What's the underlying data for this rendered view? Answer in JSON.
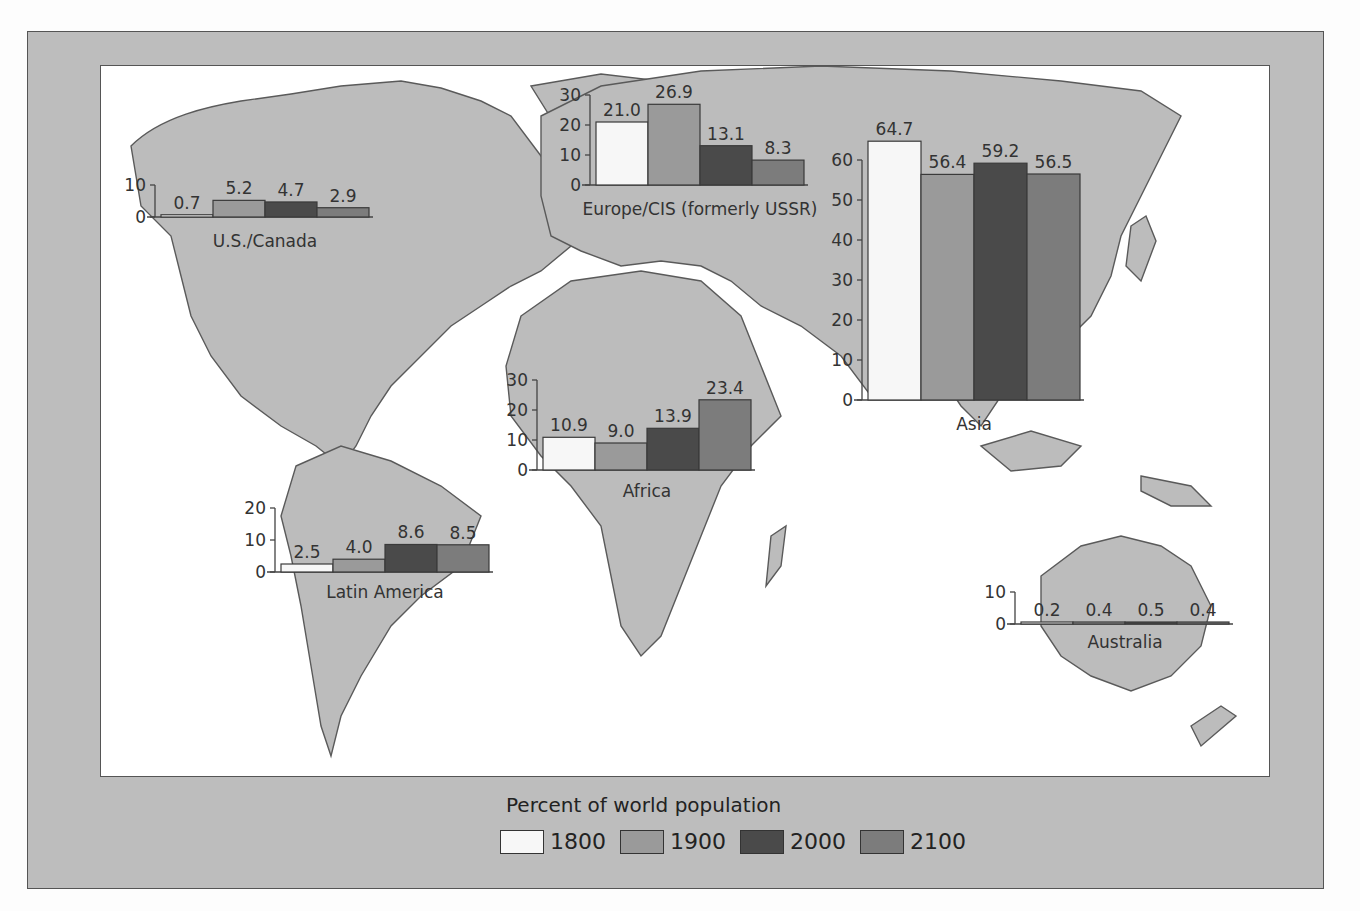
{
  "legend": {
    "title": "Percent of world population",
    "items": [
      {
        "label": "1800",
        "color": "#f7f7f7"
      },
      {
        "label": "1900",
        "color": "#9a9a9a"
      },
      {
        "label": "2000",
        "color": "#4a4a4a"
      },
      {
        "label": "2100",
        "color": "#7c7c7c"
      }
    ]
  },
  "chart_data": [
    {
      "type": "bar",
      "title": "U.S./Canada",
      "categories": [
        "1800",
        "1900",
        "2000",
        "2100"
      ],
      "values": [
        0.7,
        5.2,
        4.7,
        2.9
      ],
      "labels": [
        "0.7",
        "5.2",
        "4.7",
        "2.9"
      ],
      "yticks": [
        "0",
        "10"
      ],
      "ylim": [
        0,
        10
      ],
      "ylabel": "Percent of world population"
    },
    {
      "type": "bar",
      "title": "Europe/CIS (formerly USSR)",
      "categories": [
        "1800",
        "1900",
        "2000",
        "2100"
      ],
      "values": [
        21.0,
        26.9,
        13.1,
        8.3
      ],
      "labels": [
        "21.0",
        "26.9",
        "13.1",
        "8.3"
      ],
      "yticks": [
        "0",
        "10",
        "20",
        "30"
      ],
      "ylim": [
        0,
        30
      ],
      "ylabel": "Percent of world population"
    },
    {
      "type": "bar",
      "title": "Asia",
      "categories": [
        "1800",
        "1900",
        "2000",
        "2100"
      ],
      "values": [
        64.7,
        56.4,
        59.2,
        56.5
      ],
      "labels": [
        "64.7",
        "56.4",
        "59.2",
        "56.5"
      ],
      "yticks": [
        "0",
        "10",
        "20",
        "30",
        "40",
        "50",
        "60"
      ],
      "ylim": [
        0,
        60
      ],
      "ylabel": "Percent of world population"
    },
    {
      "type": "bar",
      "title": "Africa",
      "categories": [
        "1800",
        "1900",
        "2000",
        "2100"
      ],
      "values": [
        10.9,
        9.0,
        13.9,
        23.4
      ],
      "labels": [
        "10.9",
        "9.0",
        "13.9",
        "23.4"
      ],
      "yticks": [
        "0",
        "10",
        "20",
        "30"
      ],
      "ylim": [
        0,
        30
      ],
      "ylabel": "Percent of world population"
    },
    {
      "type": "bar",
      "title": "Latin America",
      "categories": [
        "1800",
        "1900",
        "2000",
        "2100"
      ],
      "values": [
        2.5,
        4.0,
        8.6,
        8.5
      ],
      "labels": [
        "2.5",
        "4.0",
        "8.6",
        "8.5"
      ],
      "yticks": [
        "0",
        "10",
        "20"
      ],
      "ylim": [
        0,
        20
      ],
      "ylabel": "Percent of world population"
    },
    {
      "type": "bar",
      "title": "Australia",
      "categories": [
        "1800",
        "1900",
        "2000",
        "2100"
      ],
      "values": [
        0.2,
        0.4,
        0.5,
        0.4
      ],
      "labels": [
        "0.2",
        "0.4",
        "0.5",
        "0.4"
      ],
      "yticks": [
        "0",
        "10"
      ],
      "ylim": [
        0,
        10
      ],
      "ylabel": "Percent of world population"
    }
  ]
}
